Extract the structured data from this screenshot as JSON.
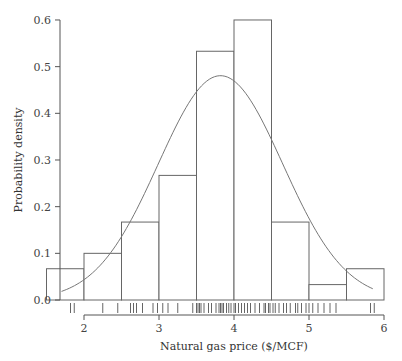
{
  "chart_data": {
    "type": "bar",
    "subtype": "histogram-with-normal-density-and-rug",
    "title": "",
    "xlabel": "Natural gas price ($/MCF)",
    "ylabel": "Probability density",
    "xlim": [
      1.5,
      6.0
    ],
    "ylim": [
      0,
      0.6
    ],
    "x_ticks": [
      2,
      3,
      4,
      5,
      6
    ],
    "x_tick_labels": [
      "2",
      "3",
      "4",
      "5",
      "6"
    ],
    "y_ticks": [
      0.0,
      0.1,
      0.2,
      0.3,
      0.4,
      0.5,
      0.6
    ],
    "y_tick_labels": [
      "0.0",
      "0.1",
      "0.2",
      "0.3",
      "0.4",
      "0.5",
      "0.6"
    ],
    "grid": false,
    "bins": [
      {
        "start": 1.5,
        "end": 2.0,
        "density": 0.067
      },
      {
        "start": 2.0,
        "end": 2.5,
        "density": 0.1
      },
      {
        "start": 2.5,
        "end": 3.0,
        "density": 0.167
      },
      {
        "start": 3.0,
        "end": 3.5,
        "density": 0.267
      },
      {
        "start": 3.5,
        "end": 4.0,
        "density": 0.533
      },
      {
        "start": 4.0,
        "end": 4.5,
        "density": 0.6
      },
      {
        "start": 4.5,
        "end": 5.0,
        "density": 0.167
      },
      {
        "start": 5.0,
        "end": 5.5,
        "density": 0.033
      },
      {
        "start": 5.5,
        "end": 6.0,
        "density": 0.067
      }
    ],
    "normal_curve": {
      "mean": 3.82,
      "sd": 0.83,
      "x_range": [
        1.7,
        5.85
      ]
    },
    "rug": [
      1.82,
      1.87,
      2.25,
      2.45,
      2.62,
      2.66,
      2.7,
      2.78,
      2.92,
      2.98,
      3.05,
      3.12,
      3.25,
      3.45,
      3.5,
      3.52,
      3.54,
      3.56,
      3.6,
      3.66,
      3.7,
      3.76,
      3.8,
      3.82,
      3.84,
      3.86,
      3.9,
      3.93,
      3.96,
      4.0,
      4.02,
      4.06,
      4.1,
      4.14,
      4.18,
      4.22,
      4.28,
      4.34,
      4.4,
      4.42,
      4.46,
      4.48,
      4.52,
      4.55,
      4.6,
      4.66,
      4.7,
      4.75,
      4.82,
      4.85,
      4.9,
      4.96,
      5.0,
      5.05,
      5.12,
      5.2,
      5.28,
      5.36,
      5.82,
      5.87
    ]
  }
}
